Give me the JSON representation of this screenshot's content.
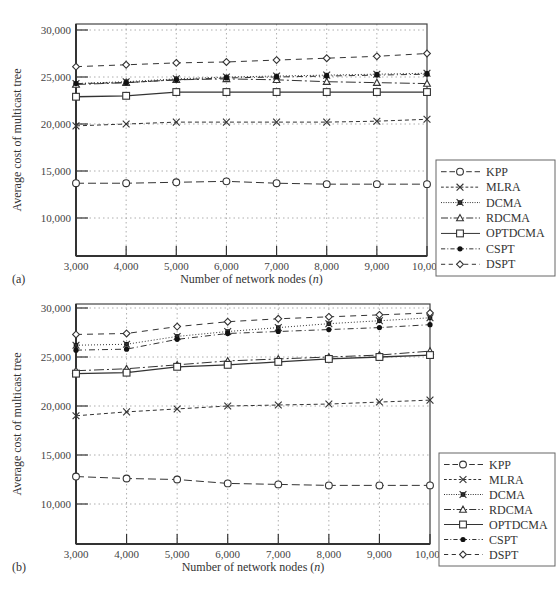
{
  "figure": {
    "panels": [
      {
        "label": "(a)"
      },
      {
        "label": "(b)"
      }
    ]
  },
  "chart_data": [
    {
      "type": "line",
      "panel": "(a)",
      "title": "",
      "xlabel": "Number of network nodes (n)",
      "ylabel": "Average cost of multicast tree",
      "x": [
        3000,
        4000,
        5000,
        6000,
        7000,
        8000,
        9000,
        10000
      ],
      "x_tick_labels": [
        "3,000",
        "4,000",
        "5,000",
        "6,000",
        "7,000",
        "8,000",
        "9,000",
        "10,000"
      ],
      "y_tick_labels": [
        "10,000",
        "15,000",
        "20,000",
        "25,000",
        "30,000"
      ],
      "y_ticks": [
        10000,
        15000,
        20000,
        25000,
        30000
      ],
      "ylim": [
        6200,
        30000
      ],
      "xlim": [
        3000,
        10000
      ],
      "grid": true,
      "legend_position": "right",
      "series": [
        {
          "name": "KPP",
          "marker": "circle",
          "dash": "8,4",
          "values": [
            13700,
            13700,
            13800,
            13900,
            13700,
            13600,
            13600,
            13600
          ]
        },
        {
          "name": "MLRA",
          "marker": "x",
          "dash": "4,3",
          "values": [
            19800,
            20000,
            20200,
            20200,
            20200,
            20200,
            20300,
            20500
          ]
        },
        {
          "name": "DCMA",
          "marker": "asterisk",
          "dash": "1,2",
          "values": [
            24300,
            24500,
            24800,
            25000,
            25100,
            25200,
            25300,
            25400
          ]
        },
        {
          "name": "RDCMA",
          "marker": "triangle",
          "dash": "10,3,2,3",
          "values": [
            24200,
            24400,
            24700,
            24800,
            24700,
            24500,
            24400,
            24300
          ]
        },
        {
          "name": "OPTDCMA",
          "marker": "square",
          "dash": "",
          "values": [
            22900,
            23000,
            23400,
            23400,
            23400,
            23400,
            23400,
            23400
          ]
        },
        {
          "name": "CSPT",
          "marker": "dot",
          "dash": "6,3,1,3",
          "values": [
            24300,
            24400,
            24700,
            24900,
            25000,
            25100,
            25200,
            25300
          ]
        },
        {
          "name": "DSPT",
          "marker": "diamond",
          "dash": "6,5",
          "values": [
            26100,
            26300,
            26500,
            26600,
            26800,
            27000,
            27200,
            27500
          ]
        }
      ]
    },
    {
      "type": "line",
      "panel": "(b)",
      "title": "",
      "xlabel": "Number of network nodes (n)",
      "ylabel": "Average cost of multicast tree",
      "x": [
        3000,
        4000,
        5000,
        6000,
        7000,
        8000,
        9000,
        10000
      ],
      "x_tick_labels": [
        "3,000",
        "4,000",
        "5,000",
        "6,000",
        "7,000",
        "8,000",
        "9,000",
        "10,000"
      ],
      "y_tick_labels": [
        "10,000",
        "15,000",
        "20,000",
        "25,000",
        "30,000"
      ],
      "y_ticks": [
        10000,
        15000,
        20000,
        25000,
        30000
      ],
      "ylim": [
        6000,
        30000
      ],
      "xlim": [
        3000,
        10000
      ],
      "grid": true,
      "legend_position": "right",
      "series": [
        {
          "name": "KPP",
          "marker": "circle",
          "dash": "8,4",
          "values": [
            12800,
            12600,
            12500,
            12100,
            12000,
            11900,
            11900,
            11900
          ]
        },
        {
          "name": "MLRA",
          "marker": "x",
          "dash": "4,3",
          "values": [
            19000,
            19400,
            19700,
            20000,
            20100,
            20200,
            20400,
            20600
          ]
        },
        {
          "name": "DCMA",
          "marker": "asterisk",
          "dash": "1,2",
          "values": [
            26200,
            26300,
            27100,
            27600,
            28000,
            28400,
            28700,
            29000
          ]
        },
        {
          "name": "RDCMA",
          "marker": "triangle",
          "dash": "10,3,2,3",
          "values": [
            23600,
            23800,
            24200,
            24600,
            24800,
            25000,
            25200,
            25600
          ]
        },
        {
          "name": "OPTDCMA",
          "marker": "square",
          "dash": "",
          "values": [
            23300,
            23400,
            24000,
            24200,
            24500,
            24800,
            25000,
            25200
          ]
        },
        {
          "name": "CSPT",
          "marker": "dot",
          "dash": "6,3,1,3",
          "values": [
            25700,
            25800,
            26800,
            27400,
            27600,
            27800,
            28000,
            28300
          ]
        },
        {
          "name": "DSPT",
          "marker": "diamond",
          "dash": "6,5",
          "values": [
            27300,
            27400,
            28100,
            28600,
            28900,
            29100,
            29300,
            29500
          ]
        }
      ]
    }
  ]
}
